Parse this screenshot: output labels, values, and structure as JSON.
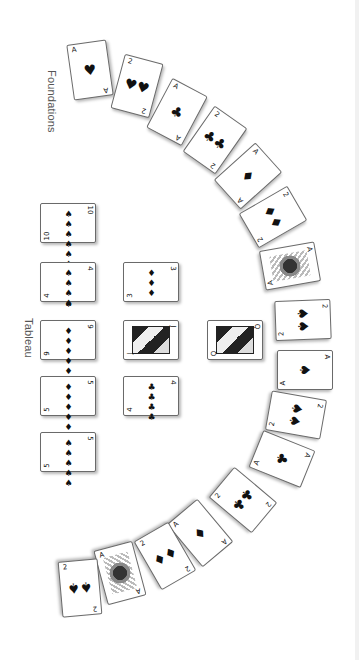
{
  "orientation": "rotated-90-clockwise",
  "labels": {
    "foundations": "Foundations",
    "tableau": "Tableau"
  },
  "suit_glyphs": {
    "spades": "♠",
    "hearts": "♥",
    "clubs": "♣",
    "diamonds": "♦"
  },
  "foundations": {
    "cards": [
      {
        "rank": "A",
        "suit": "♥",
        "pips": "♥"
      },
      {
        "rank": "2",
        "suit": "♥",
        "pips": "♥♥"
      },
      {
        "rank": "A",
        "suit": "♣",
        "pips": "♣"
      },
      {
        "rank": "2",
        "suit": "♣",
        "pips": "♣♣"
      },
      {
        "rank": "A",
        "suit": "♦",
        "pips": "♦"
      },
      {
        "rank": "2",
        "suit": "♦",
        "pips": "♦♦"
      },
      {
        "rank": "A",
        "suit": "♠",
        "pips": "",
        "decorated": true
      },
      {
        "rank": "2",
        "suit": "♠",
        "pips": "♠♠"
      },
      {
        "rank": "A",
        "suit": "♠",
        "pips": "♠"
      },
      {
        "rank": "2",
        "suit": "♠",
        "pips": "♠♠"
      },
      {
        "rank": "A",
        "suit": "♣",
        "pips": "♣"
      },
      {
        "rank": "2",
        "suit": "♣",
        "pips": "♣♣"
      },
      {
        "rank": "A",
        "suit": "♦",
        "pips": "♦"
      },
      {
        "rank": "2",
        "suit": "♦",
        "pips": "♦♦"
      },
      {
        "rank": "A",
        "suit": "♥",
        "pips": "",
        "decorated": true
      },
      {
        "rank": "2",
        "suit": "♠",
        "pips": "♠♠"
      }
    ]
  },
  "tableau": {
    "columns": [
      {
        "cards": [
          {
            "rank": "10",
            "suit": "♠",
            "pips": "♠♠♠♠♠♠♠♠♠♠"
          },
          {
            "rank": "4",
            "suit": "♠",
            "pips": "♠♠♠♠"
          },
          {
            "rank": "9",
            "suit": "♦",
            "pips": "♦♦♦♦♦♦♦♦♦"
          },
          {
            "rank": "5",
            "suit": "♦",
            "pips": "♦♦♦♦♦"
          },
          {
            "rank": "5",
            "suit": "♠",
            "pips": "♠♠♠♠♠"
          }
        ]
      },
      {
        "cards": [
          {
            "rank": "3",
            "suit": "♦",
            "pips": "♦♦♦"
          },
          {
            "rank": "J",
            "suit": "♣",
            "face": true
          },
          {
            "rank": "4",
            "suit": "♣",
            "pips": "♣♣♣♣"
          }
        ]
      },
      {
        "cards": [
          {
            "rank": "Q",
            "suit": "♠",
            "face": true
          }
        ]
      }
    ]
  }
}
